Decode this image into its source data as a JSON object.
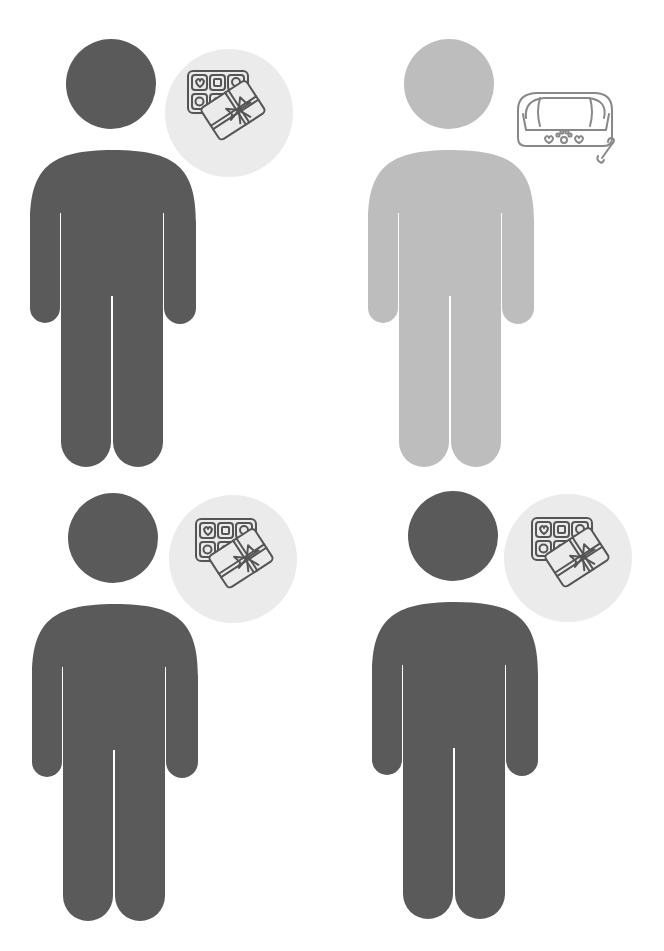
{
  "colors": {
    "background": "#ffffff",
    "figure_dark": "#5a5a5a",
    "figure_light": "#bdbdbd",
    "badge_bg": "#ebebeb",
    "icon_stroke": "#555555",
    "icon_stroke_light": "#888888"
  },
  "figures": [
    {
      "position": "top-left",
      "tone": "dark",
      "icon": "chocolate-box-gift-icon",
      "badge": true
    },
    {
      "position": "top-right",
      "tone": "light",
      "icon": "pet-bed-bone-icon",
      "badge": false
    },
    {
      "position": "bottom-left",
      "tone": "dark",
      "icon": "chocolate-box-gift-icon",
      "badge": true
    },
    {
      "position": "bottom-right",
      "tone": "dark",
      "icon": "chocolate-box-gift-icon",
      "badge": true
    }
  ]
}
